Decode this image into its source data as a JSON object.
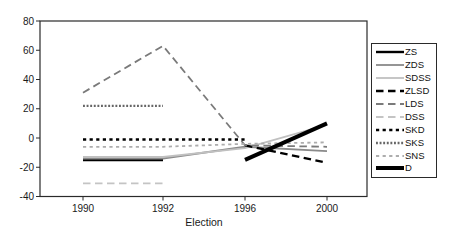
{
  "chart_data": {
    "type": "line",
    "title": "",
    "xlabel": "Election",
    "ylabel": "",
    "x_categories": [
      "1990",
      "1992",
      "1996",
      "2000"
    ],
    "ylim": [
      -40,
      80
    ],
    "yticks": [
      80,
      60,
      40,
      20,
      0,
      -20,
      -40
    ],
    "grid": false,
    "legend_position": "right",
    "series": [
      {
        "name": "ZS",
        "color": "#000000",
        "style": "solid",
        "width": 2.4,
        "values": [
          -15,
          -15,
          null,
          null
        ]
      },
      {
        "name": "ZDS",
        "color": "#8a8a8a",
        "style": "solid",
        "width": 1.8,
        "values": [
          -14,
          -14,
          -6,
          -9
        ]
      },
      {
        "name": "SDSS",
        "color": "#c0c0c0",
        "style": "solid",
        "width": 1.8,
        "values": [
          -13,
          -13,
          -7,
          9
        ]
      },
      {
        "name": "ZLSD",
        "color": "#000000",
        "style": "longdash",
        "width": 2.4,
        "values": [
          null,
          null,
          -5,
          -17
        ]
      },
      {
        "name": "LDS",
        "color": "#7a7a7a",
        "style": "longdash",
        "width": 1.8,
        "values": [
          31,
          63,
          -5,
          -6
        ]
      },
      {
        "name": "DSS",
        "color": "#c4c4c4",
        "style": "longdash",
        "width": 1.8,
        "values": [
          -31,
          -31,
          null,
          null
        ]
      },
      {
        "name": "SKD",
        "color": "#000000",
        "style": "shortdash",
        "width": 2.4,
        "values": [
          -1,
          -1,
          -1,
          null
        ]
      },
      {
        "name": "SKS",
        "color": "#666666",
        "style": "densedash",
        "width": 2.4,
        "values": [
          22,
          22,
          null,
          null
        ]
      },
      {
        "name": "SNS",
        "color": "#adadad",
        "style": "shortdash",
        "width": 1.8,
        "values": [
          -6,
          -6,
          -4,
          -3
        ]
      },
      {
        "name": "D",
        "color": "#000000",
        "style": "solid",
        "width": 4.0,
        "values": [
          null,
          null,
          -15,
          10
        ]
      }
    ]
  }
}
